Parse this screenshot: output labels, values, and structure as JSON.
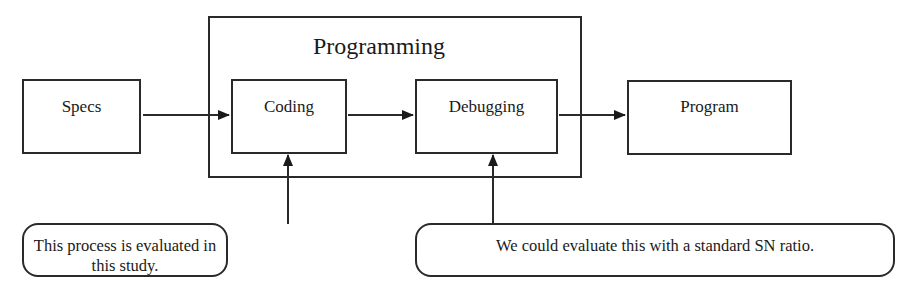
{
  "diagram": {
    "inputs": {
      "specs_label": "Specs"
    },
    "group": {
      "title": "Programming",
      "steps": [
        {
          "label": "Coding"
        },
        {
          "label": "Debugging"
        }
      ]
    },
    "output": {
      "program_label": "Program"
    },
    "callouts": [
      {
        "text": "This process is evaluated in this study.",
        "target": "Coding"
      },
      {
        "text": "We could evaluate this with a standard SN ratio.",
        "target": "Debugging"
      }
    ],
    "flow": [
      "Specs",
      "Coding",
      "Debugging",
      "Program"
    ],
    "colors": {
      "stroke": "#2a2a2a",
      "background": "#ffffff"
    }
  }
}
